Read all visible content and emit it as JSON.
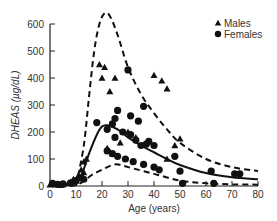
{
  "chart_data": {
    "type": "scatter",
    "title": "",
    "xlabel": "Age (years)",
    "ylabel": "DHEAS (µg/dL)",
    "xlim": [
      0,
      80
    ],
    "ylim": [
      0,
      600
    ],
    "xticks": [
      0,
      10,
      20,
      30,
      40,
      50,
      60,
      70,
      80
    ],
    "yticks": [
      0,
      100,
      200,
      300,
      400,
      500,
      600
    ],
    "grid": false,
    "legend_position": "upper right",
    "legend": [
      {
        "label": "Males",
        "marker": "triangle"
      },
      {
        "label": "Females",
        "marker": "circle"
      }
    ],
    "series": [
      {
        "name": "Males",
        "marker": "triangle",
        "points": [
          [
            0,
            5
          ],
          [
            1,
            8
          ],
          [
            2,
            5
          ],
          [
            4,
            3
          ],
          [
            5,
            6
          ],
          [
            7,
            10
          ],
          [
            8,
            15
          ],
          [
            9,
            25
          ],
          [
            10,
            20
          ],
          [
            11,
            40
          ],
          [
            12,
            60
          ],
          [
            12,
            30
          ],
          [
            13,
            90
          ],
          [
            14,
            100
          ],
          [
            13,
            50
          ],
          [
            19,
            450
          ],
          [
            21,
            440
          ],
          [
            20,
            400
          ],
          [
            25,
            400
          ],
          [
            23,
            350
          ],
          [
            24,
            120
          ],
          [
            22,
            140
          ],
          [
            27,
            160
          ],
          [
            30,
            200
          ],
          [
            33,
            180
          ],
          [
            40,
            410
          ],
          [
            43,
            390
          ],
          [
            45,
            360
          ],
          [
            50,
            175
          ],
          [
            48,
            150
          ],
          [
            45,
            100
          ]
        ]
      },
      {
        "name": "Females",
        "marker": "circle",
        "points": [
          [
            1,
            10
          ],
          [
            3,
            6
          ],
          [
            5,
            8
          ],
          [
            8,
            12
          ],
          [
            10,
            20
          ],
          [
            12,
            30
          ],
          [
            13,
            25
          ],
          [
            30,
            430
          ],
          [
            36,
            295
          ],
          [
            31,
            260
          ],
          [
            34,
            240
          ],
          [
            26,
            280
          ],
          [
            25,
            250
          ],
          [
            24,
            230
          ],
          [
            18,
            235
          ],
          [
            22,
            210
          ],
          [
            25,
            180
          ],
          [
            28,
            200
          ],
          [
            31,
            190
          ],
          [
            33,
            170
          ],
          [
            35,
            150
          ],
          [
            37,
            155
          ],
          [
            40,
            150
          ],
          [
            38,
            165
          ],
          [
            22,
            130
          ],
          [
            24,
            120
          ],
          [
            26,
            110
          ],
          [
            29,
            100
          ],
          [
            32,
            90
          ],
          [
            36,
            80
          ],
          [
            40,
            70
          ],
          [
            42,
            60
          ],
          [
            48,
            110
          ],
          [
            50,
            55
          ],
          [
            51,
            10
          ],
          [
            62,
            55
          ],
          [
            63,
            10
          ],
          [
            71,
            45
          ],
          [
            73,
            45
          ]
        ]
      }
    ],
    "curves": [
      {
        "name": "upper-bound",
        "style": "dashed",
        "points": [
          [
            10,
            0
          ],
          [
            13,
            150
          ],
          [
            15,
            330
          ],
          [
            17,
            500
          ],
          [
            19,
            600
          ],
          [
            21,
            640
          ],
          [
            23,
            630
          ],
          [
            26,
            560
          ],
          [
            30,
            440
          ],
          [
            35,
            340
          ],
          [
            40,
            270
          ],
          [
            45,
            210
          ],
          [
            50,
            160
          ],
          [
            60,
            100
          ],
          [
            70,
            70
          ],
          [
            80,
            55
          ]
        ]
      },
      {
        "name": "mean",
        "style": "solid",
        "points": [
          [
            8,
            0
          ],
          [
            12,
            40
          ],
          [
            15,
            120
          ],
          [
            18,
            190
          ],
          [
            20,
            220
          ],
          [
            22,
            225
          ],
          [
            26,
            210
          ],
          [
            30,
            180
          ],
          [
            35,
            150
          ],
          [
            40,
            125
          ],
          [
            45,
            100
          ],
          [
            50,
            78
          ],
          [
            60,
            48
          ],
          [
            70,
            32
          ],
          [
            80,
            25
          ]
        ]
      },
      {
        "name": "lower-bound",
        "style": "dashed",
        "points": [
          [
            0,
            0
          ],
          [
            8,
            0
          ],
          [
            12,
            12
          ],
          [
            16,
            40
          ],
          [
            20,
            60
          ],
          [
            25,
            80
          ],
          [
            30,
            70
          ],
          [
            40,
            45
          ],
          [
            50,
            20
          ],
          [
            60,
            10
          ],
          [
            70,
            6
          ],
          [
            80,
            5
          ]
        ]
      }
    ]
  }
}
